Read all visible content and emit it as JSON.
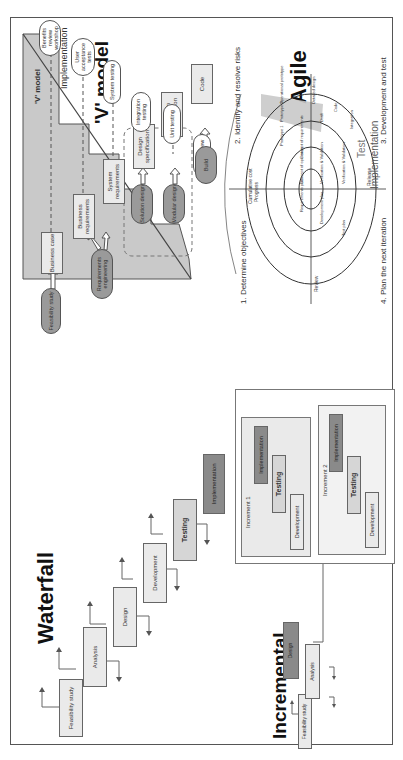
{
  "orientation": "rotated 90deg counter-clockwise",
  "waterfall": {
    "title": "Waterfall",
    "steps": [
      "Feasibility study",
      "Analysis",
      "Design",
      "Development",
      "Testing",
      "Implementation"
    ]
  },
  "incremental": {
    "title": "Incremental",
    "steps": [
      "Feasibility study",
      "Analysis",
      "Design"
    ],
    "increments": [
      {
        "label": "Increment 1",
        "steps": [
          "Development",
          "Testing",
          "Implementation"
        ]
      },
      {
        "label": "Increment 2",
        "steps": [
          "Development",
          "Testing",
          "Implementation"
        ]
      }
    ]
  },
  "vmodel": {
    "title": "'V' model",
    "inner_title": "'V' model",
    "implementation_label": "Implementation",
    "left_boxes": [
      "Business case",
      "Business requirements",
      "System requirements",
      "Design specification",
      "Program specification",
      "Code"
    ],
    "right_pills": [
      "Benefits review workshop",
      "User acceptance tests",
      "System testing",
      "Integration testing",
      "Unit testing",
      "Code review"
    ],
    "inputs": [
      "Feasibility study",
      "Requirements engineering",
      "Solution design",
      "Modular design",
      "Build"
    ]
  },
  "agile": {
    "title": "Agile",
    "quadrants": [
      "1. Determine objectives",
      "2. Identify and resolve risks",
      "3. Development and test",
      "4. Plan the next iteration"
    ],
    "axis_labels": {
      "top": "Cumulative cost",
      "progress": "Progress",
      "review": "Review",
      "release": "Release"
    },
    "inner_labels": [
      "Requirements plan",
      "Concept of operation",
      "Concept of requirements",
      "Development plan",
      "Verification & Validation",
      "Test plan",
      "Verification & Validation",
      "Prototype 1",
      "Prototype 2",
      "Operational prototype",
      "Draft",
      "Detailed design",
      "Code",
      "Integration"
    ],
    "test_label": "Test",
    "implementation_label": "Implementation"
  }
}
